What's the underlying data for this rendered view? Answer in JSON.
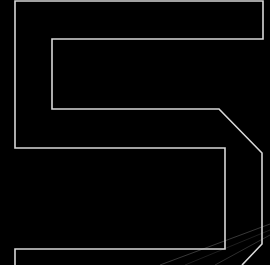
{
  "figure": {
    "glyph": "5",
    "background": "#000000",
    "stroke_color": "#d8d8d8",
    "stroke_width": 1.6,
    "outline_points": [
      [
        15,
        265
      ],
      [
        15,
        249
      ],
      [
        225,
        249
      ],
      [
        225,
        148
      ],
      [
        15,
        148
      ],
      [
        15,
        1
      ],
      [
        263,
        1
      ],
      [
        263,
        39
      ],
      [
        52,
        39
      ],
      [
        52,
        109
      ],
      [
        219,
        109
      ],
      [
        262,
        153
      ],
      [
        262,
        244
      ],
      [
        242,
        265
      ]
    ],
    "streaks": [
      {
        "x1": 270,
        "y1": 224,
        "x2": 160,
        "y2": 265,
        "opacity": 0.22
      },
      {
        "x1": 270,
        "y1": 235,
        "x2": 215,
        "y2": 265,
        "opacity": 0.18
      },
      {
        "x1": 270,
        "y1": 230,
        "x2": 185,
        "y2": 265,
        "opacity": 0.12
      }
    ]
  }
}
